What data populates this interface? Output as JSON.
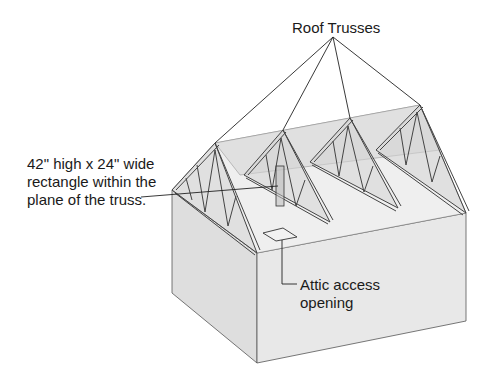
{
  "diagram": {
    "title_label": "Roof Trusses",
    "callout_truss": {
      "line1": "42\" high x 24\" wide",
      "line2": "rectangle within the",
      "line3": "plane of the truss."
    },
    "callout_attic": {
      "line1": "Attic access",
      "line2": "opening"
    },
    "colors": {
      "wall_left": "#dcdcdc",
      "wall_front": "#e6e6e6",
      "ceiling": "#ededed",
      "truss_fill": "#d8d8d8",
      "line": "#333333"
    }
  }
}
